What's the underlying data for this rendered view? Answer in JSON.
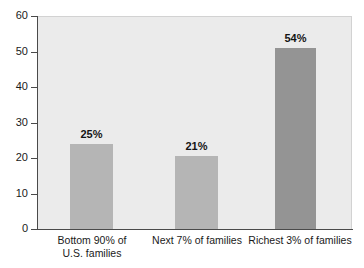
{
  "chart_data": {
    "type": "bar",
    "title": "",
    "subtitle": "",
    "xlabel": "",
    "ylabel": "",
    "categories": [
      "Bottom 90% of U.S. families",
      "Next 7% of families",
      "Richest 3% of families"
    ],
    "category_lines": [
      [
        "Bottom 90% of",
        "U.S. families"
      ],
      [
        "Next 7% of families"
      ],
      [
        "Richest 3% of families"
      ]
    ],
    "values": [
      25,
      21,
      54
    ],
    "plotted_values": [
      24.0,
      20.5,
      51.0
    ],
    "data_labels": [
      "25%",
      "21%",
      "54%"
    ],
    "ylim": [
      0,
      60
    ],
    "ytick_values": [
      0,
      10,
      20,
      30,
      40,
      50,
      60
    ],
    "ytick_labels": [
      "0",
      "10",
      "20",
      "30",
      "40",
      "50",
      "60"
    ],
    "grid": false,
    "legend": false,
    "legend_position": "none",
    "bar_colors": [
      "#b5b5b5",
      "#b5b5b5",
      "#949494"
    ],
    "plot_background": "#ebebeb",
    "axis_color": "#4a4a4a",
    "text_color": "#1a1a1a"
  }
}
